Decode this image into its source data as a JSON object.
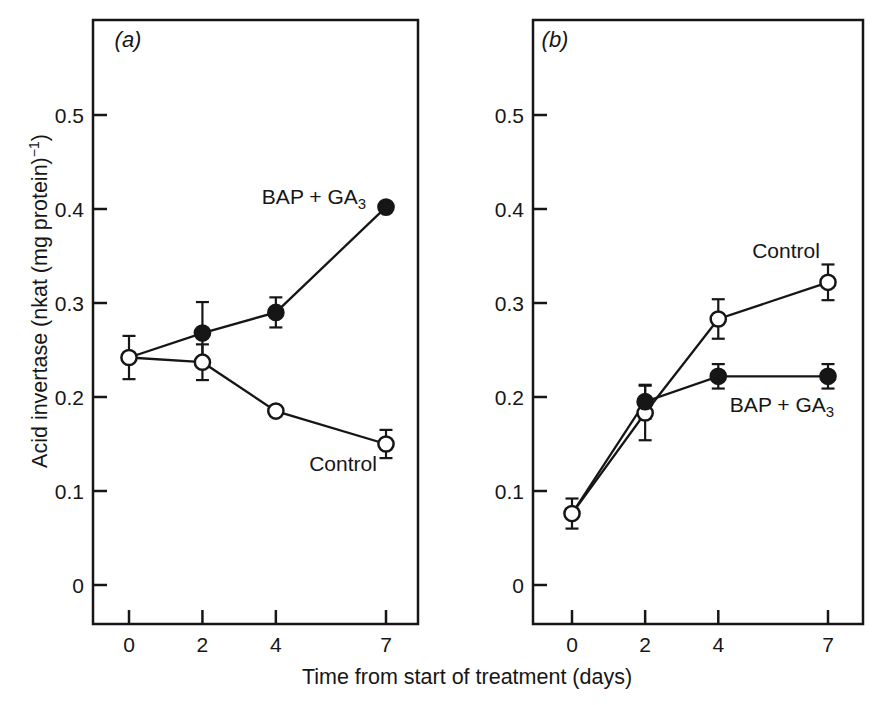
{
  "figure": {
    "background": "#ffffff",
    "ink": "#161616",
    "x_axis_label": "Time from start of treatment (days)",
    "y_axis_label_main": "Acid invertase (nkat (mg protein)",
    "y_axis_label_sup": "−1",
    "y_axis_label_end": ")"
  },
  "chart_data": [
    {
      "type": "line",
      "panel_label": "(a)",
      "xlabel": "Time from start of treatment (days)",
      "ylabel": "Acid invertase (nkat (mg protein))^-1",
      "x_ticks": [
        0,
        2,
        4,
        7
      ],
      "x_tick_labels": [
        "0",
        "2",
        "4",
        "7"
      ],
      "y_ticks": [
        0,
        0.1,
        0.2,
        0.3,
        0.4,
        0.5
      ],
      "y_tick_labels": [
        "0",
        "0.1",
        "0.2",
        "0.3",
        "0.4",
        "0.5"
      ],
      "ylim": [
        -0.045,
        0.6
      ],
      "grid": false,
      "legend_position": "in-plot-annotations",
      "series": [
        {
          "name": "BAP + GA3",
          "marker": "filled",
          "label_main": "BAP + GA",
          "label_sub": "3",
          "points": [
            {
              "x": 0,
              "y": 0.242,
              "marker": "none"
            },
            {
              "x": 2,
              "y": 0.268,
              "err": 0.033
            },
            {
              "x": 4,
              "y": 0.29,
              "err": 0.016
            },
            {
              "x": 7,
              "y": 0.402
            }
          ]
        },
        {
          "name": "Control",
          "marker": "open",
          "label_main": "Control",
          "points": [
            {
              "x": 0,
              "y": 0.242,
              "err": 0.023
            },
            {
              "x": 2,
              "y": 0.237,
              "err": 0.019
            },
            {
              "x": 4,
              "y": 0.185
            },
            {
              "x": 7,
              "y": 0.15,
              "err": 0.015
            }
          ]
        }
      ]
    },
    {
      "type": "line",
      "panel_label": "(b)",
      "xlabel": "Time from start of treatment (days)",
      "ylabel": "Acid invertase (nkat (mg protein))^-1",
      "x_ticks": [
        0,
        2,
        4,
        7
      ],
      "x_tick_labels": [
        "0",
        "2",
        "4",
        "7"
      ],
      "y_ticks": [
        0,
        0.1,
        0.2,
        0.3,
        0.4,
        0.5
      ],
      "y_tick_labels": [
        "0",
        "0.1",
        "0.2",
        "0.3",
        "0.4",
        "0.5"
      ],
      "ylim": [
        -0.045,
        0.6
      ],
      "grid": false,
      "legend_position": "in-plot-annotations",
      "series": [
        {
          "name": "Control",
          "marker": "open",
          "label_main": "Control",
          "points": [
            {
              "x": 0,
              "y": 0.076,
              "err": 0.016
            },
            {
              "x": 2,
              "y": 0.183,
              "err": 0.029
            },
            {
              "x": 4,
              "y": 0.283,
              "err": 0.021
            },
            {
              "x": 7,
              "y": 0.322,
              "err": 0.019
            }
          ]
        },
        {
          "name": "BAP + GA3",
          "marker": "filled",
          "label_main": "BAP + GA",
          "label_sub": "3",
          "points": [
            {
              "x": 0,
              "y": 0.076,
              "marker": "none"
            },
            {
              "x": 2,
              "y": 0.195,
              "err": 0.018
            },
            {
              "x": 4,
              "y": 0.222,
              "err": 0.013
            },
            {
              "x": 7,
              "y": 0.222,
              "err": 0.013
            }
          ]
        }
      ]
    }
  ]
}
